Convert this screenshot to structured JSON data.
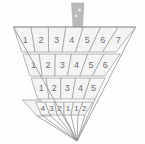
{
  "figure": {
    "background_color": "#fefefe",
    "cell_fill_color": "#f4f4f4",
    "cell_stroke_color": "#9a9a9a",
    "label_color": "#6f6f6f",
    "marker_color": "#b9b9b9"
  },
  "marker": {
    "name": "top-marker",
    "description": "small vertical gray tab above the triangle"
  },
  "rows": [
    {
      "index": 1,
      "name": "row-1",
      "cells": [
        {
          "label": "1"
        },
        {
          "label": "2"
        },
        {
          "label": "3"
        },
        {
          "label": "4"
        },
        {
          "label": "5"
        },
        {
          "label": "6"
        },
        {
          "label": "7"
        }
      ]
    },
    {
      "index": 2,
      "name": "row-2",
      "cells": [
        {
          "label": "1"
        },
        {
          "label": "2"
        },
        {
          "label": "3"
        },
        {
          "label": "4"
        },
        {
          "label": "5"
        },
        {
          "label": "6"
        }
      ]
    },
    {
      "index": 3,
      "name": "row-3",
      "cells": [
        {
          "label": "1"
        },
        {
          "label": "2"
        },
        {
          "label": "3"
        },
        {
          "label": "4"
        },
        {
          "label": "5"
        }
      ]
    },
    {
      "index": 4,
      "name": "row-4",
      "cells": [
        {
          "label": "4"
        },
        {
          "label": "3"
        },
        {
          "label": "2"
        },
        {
          "label": "1"
        },
        {
          "label": "1"
        },
        {
          "label": "2"
        }
      ]
    }
  ]
}
